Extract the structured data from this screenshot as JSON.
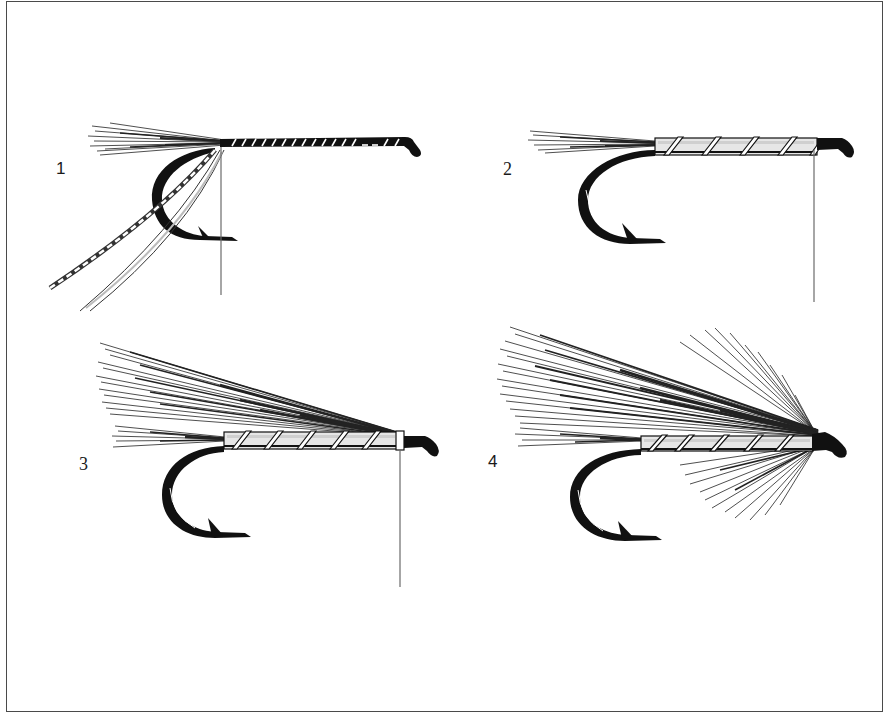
{
  "figure": {
    "colors": {
      "ink": "#111111",
      "hair": "#222222",
      "thread": "#6b6b6b",
      "frame": "#4a4a4a",
      "background": "#ffffff"
    },
    "steps": [
      {
        "number": "1",
        "label": "1"
      },
      {
        "number": "2",
        "label": "2"
      },
      {
        "number": "3",
        "label": "3"
      },
      {
        "number": "4",
        "label": "4"
      }
    ]
  }
}
